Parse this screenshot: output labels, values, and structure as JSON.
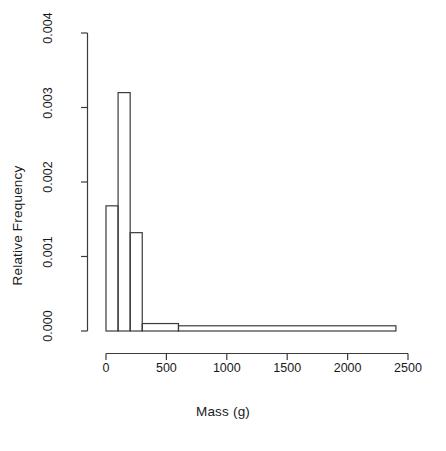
{
  "figure": {
    "background_color": "#ffffff",
    "line_color": "#3b3b3b"
  },
  "axes": {
    "x_title": "Mass (g)",
    "y_title": "Relative Frequency"
  },
  "chart_data": {
    "type": "bar",
    "title": "",
    "subtitle": "",
    "xlabel": "Mass (g)",
    "ylabel": "Relative Frequency",
    "xlim": [
      0,
      2500
    ],
    "ylim": [
      0,
      0.004
    ],
    "grid": false,
    "legend": null,
    "x_ticks": [
      0,
      500,
      1000,
      1500,
      2000,
      2500
    ],
    "x_tick_labels": [
      "0",
      "500",
      "1000",
      "1500",
      "2000",
      "2500"
    ],
    "y_ticks": [
      0.0,
      0.001,
      0.002,
      0.003,
      0.004
    ],
    "y_tick_labels": [
      "0.000",
      "0.001",
      "0.002",
      "0.003",
      "0.004"
    ],
    "bins": [
      {
        "label": "0-100",
        "x0": 0,
        "x1": 100,
        "value": 0.00168
      },
      {
        "label": "100-200",
        "x0": 100,
        "x1": 200,
        "value": 0.0032
      },
      {
        "label": "200-300",
        "x0": 200,
        "x1": 300,
        "value": 0.00132
      },
      {
        "label": "300-600",
        "x0": 300,
        "x1": 600,
        "value": 0.0001
      },
      {
        "label": "600-2400",
        "x0": 600,
        "x1": 2400,
        "value": 7e-05
      }
    ],
    "categories": [
      "0-100",
      "100-200",
      "200-300",
      "300-600",
      "600-2400"
    ],
    "values": [
      0.00168,
      0.0032,
      0.00132,
      0.0001,
      7e-05
    ]
  }
}
